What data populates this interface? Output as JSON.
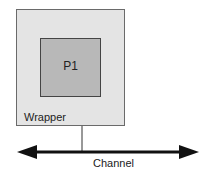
{
  "diagram": {
    "wrapper": {
      "label": "Wrapper",
      "fill": "#e4e4e4"
    },
    "process": {
      "label": "P1",
      "fill": "#b8b8b8"
    },
    "channel": {
      "label": "Channel",
      "type": "bidirectional-arrow"
    },
    "edges": [
      {
        "from": "Wrapper",
        "to": "Channel",
        "type": "line"
      }
    ]
  }
}
